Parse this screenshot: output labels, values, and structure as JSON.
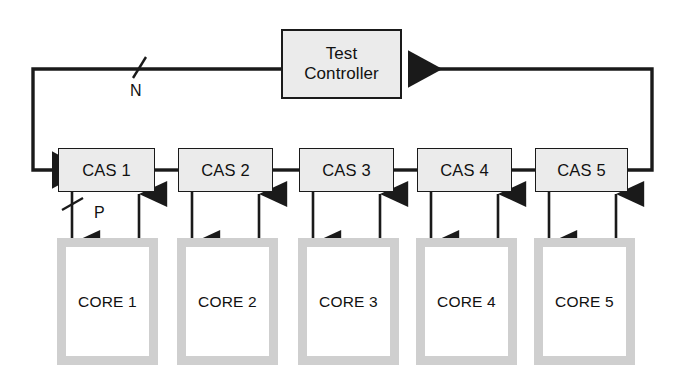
{
  "diagram": {
    "background_color": "#ffffff",
    "line_color": "#1a1a1a",
    "box_fill_color": "#ebebeb",
    "core_border_color": "#cfcfcf",
    "core_fill_color": "#ffffff"
  },
  "controller": {
    "label_line1": "Test",
    "label_line2": "Controller"
  },
  "cas_blocks": [
    {
      "label": "CAS 1"
    },
    {
      "label": "CAS 2"
    },
    {
      "label": "CAS 3"
    },
    {
      "label": "CAS 4"
    },
    {
      "label": "CAS 5"
    }
  ],
  "core_blocks": [
    {
      "label": "CORE 1"
    },
    {
      "label": "CORE 2"
    },
    {
      "label": "CORE 3"
    },
    {
      "label": "CORE 4"
    },
    {
      "label": "CORE 5"
    }
  ],
  "bus_labels": {
    "feedback_bus": "N",
    "core_bus": "P"
  }
}
